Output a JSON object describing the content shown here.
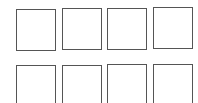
{
  "grid": {
    "rows": 2,
    "columns": 4,
    "border_color": "#555555",
    "background": "#ffffff",
    "cells": [
      {
        "row": 1,
        "col": 1,
        "label": ""
      },
      {
        "row": 1,
        "col": 2,
        "label": ""
      },
      {
        "row": 1,
        "col": 3,
        "label": ""
      },
      {
        "row": 1,
        "col": 4,
        "label": ""
      },
      {
        "row": 2,
        "col": 1,
        "label": ""
      },
      {
        "row": 2,
        "col": 2,
        "label": ""
      },
      {
        "row": 2,
        "col": 3,
        "label": ""
      },
      {
        "row": 2,
        "col": 4,
        "label": ""
      }
    ]
  }
}
